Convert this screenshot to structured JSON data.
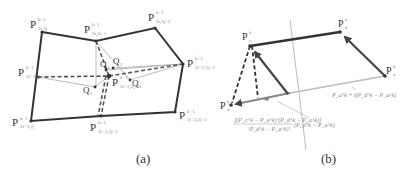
{
  "figure": {
    "panels": [
      {
        "caption": "(a)",
        "points": [
          {
            "id": "p_3i_2j",
            "main": "P",
            "sup": "k+1",
            "sub": "3i,2j"
          },
          {
            "id": "p_3i_2j1",
            "main": "P",
            "sup": "k+1",
            "sub": "3i,2j+1"
          },
          {
            "id": "p_3i_2j2",
            "main": "P",
            "sup": "k+1",
            "sub": "3i,2j+2"
          },
          {
            "id": "p_3i2_2j2",
            "main": "P",
            "sup": "k+1",
            "sub": "3i+2,2j+2"
          },
          {
            "id": "p_3i3_2j2",
            "main": "P",
            "sup": "k+1",
            "sub": "3i+3,2j+2"
          },
          {
            "id": "p_3i3_2j1",
            "main": "P",
            "sup": "k+1",
            "sub": "3i+3,2j+1"
          },
          {
            "id": "p_3i3_2j",
            "main": "P",
            "sup": "k+1",
            "sub": "3i+3,2j"
          },
          {
            "id": "p_3i1_2j",
            "main": "P",
            "sup": "k+1",
            "sub": "3i+1,2j"
          },
          {
            "id": "p_3i1_2j1",
            "main": "P",
            "sup": "k+1",
            "sub": "3i+1,2j+1"
          }
        ],
        "q_points": [
          {
            "id": "q1",
            "label": "Q",
            "sub": "1"
          },
          {
            "id": "q2",
            "label": "Q",
            "sub": "2"
          },
          {
            "id": "q3",
            "label": "Q",
            "sub": "3"
          },
          {
            "id": "q4",
            "label": "Q",
            "sub": "4"
          }
        ]
      },
      {
        "caption": "(b)",
        "points": [
          {
            "id": "pa",
            "main": "P",
            "sup": "k",
            "sub": "a"
          },
          {
            "id": "pb",
            "main": "P",
            "sup": "k",
            "sub": "b"
          },
          {
            "id": "pc",
            "main": "P",
            "sup": "k",
            "sub": "c"
          },
          {
            "id": "pd",
            "main": "P",
            "sup": "k",
            "sub": "d"
          }
        ],
        "annotations": {
          "line_formula": "P_a^k + t(P_d^k − P_a^k)",
          "projection_numerator": "[(P_c^k − P_a^k)·(P_d^k − P_a^k)]",
          "projection_denominator": "|P_d^k − P_a^k|²",
          "projection_tail": "(P_d^k − P_a^k)"
        }
      }
    ]
  }
}
